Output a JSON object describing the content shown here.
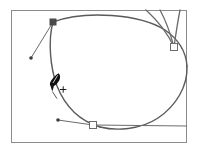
{
  "app": {
    "title": "Vector Path Editor Canvas",
    "active_tool": "pen-tool",
    "cursor_label": "pen-tool-add-point-cursor"
  },
  "colors": {
    "artboard_background": "#ffffff",
    "artboard_border": "#8c8c8c",
    "path_stroke": "#5a5a5a",
    "handle_line": "#6b6b6b",
    "anchor_selected_fill": "#4a4a4a",
    "anchor_unselected_fill": "#ffffff",
    "anchor_stroke": "#6b6b6b",
    "handle_dot_fill": "#3c3c3c",
    "cursor_fill": "#101010",
    "page_background": "#ffffff"
  },
  "artboard": {
    "name": "artboard-frame",
    "x": 11,
    "y": 10,
    "width": 176,
    "height": 133,
    "border_width": 1
  },
  "path": {
    "name": "bezier-ellipse-path",
    "closed": false,
    "stroke_width": 1.4,
    "description": "Large open ellipse-like bezier path spanning the artboard",
    "segments": [
      {
        "name": "segment-top",
        "d": "M 53 22 C 85 10 140 14 165 30 C 178 39 186 52 187 66"
      },
      {
        "name": "segment-right-bottom",
        "d": "M 187 66 C 188 86 176 106 158 118 C 140 130 116 131 100 127"
      },
      {
        "name": "segment-bottom-left",
        "d": "M 100 127 C 80 121 65 106 57 86 C 50 67 48 40 53 22"
      }
    ]
  },
  "handle_curves": {
    "name": "direction-curve-cluster",
    "stroke_width": 1.3,
    "curves": [
      {
        "name": "handle-curve-1",
        "d": "M 174 47 C 168 34 157 20 146 10"
      },
      {
        "name": "handle-curve-2",
        "d": "M 174 47 C 170 32 165 19 160 10"
      },
      {
        "name": "handle-curve-3",
        "d": "M 174 47 C 176 33 178 20 180 10"
      }
    ]
  },
  "anchors": [
    {
      "name": "anchor-point-top-left",
      "label": "Selected anchor (filled)",
      "x": 53,
      "y": 22,
      "size": 6,
      "state": "selected"
    },
    {
      "name": "anchor-point-right",
      "label": "Unselected anchor (hollow)",
      "x": 174,
      "y": 47,
      "size": 7,
      "state": "unselected"
    },
    {
      "name": "anchor-point-bottom",
      "label": "Unselected anchor (hollow)",
      "x": 93,
      "y": 125,
      "size": 7,
      "state": "unselected"
    }
  ],
  "direction_handles": [
    {
      "name": "direction-handle-top-left",
      "from_x": 53,
      "from_y": 22,
      "to_x": 31,
      "to_y": 58,
      "dot_radius": 1.8
    },
    {
      "name": "direction-handle-bottom-left",
      "from_x": 93,
      "from_y": 125,
      "to_x": 58,
      "to_y": 120,
      "dot_radius": 1.8
    },
    {
      "name": "direction-handle-bottom-right",
      "from_x": 93,
      "from_y": 125,
      "to_x": 187,
      "to_y": 126,
      "dot_radius": 0
    }
  ],
  "cursor": {
    "name": "pen-tool-cursor",
    "x": 55,
    "y": 80,
    "tip_x": 52,
    "tip_y": 92,
    "badge": "+",
    "badge_x": 63,
    "badge_y": 92,
    "badge_size": 7
  }
}
